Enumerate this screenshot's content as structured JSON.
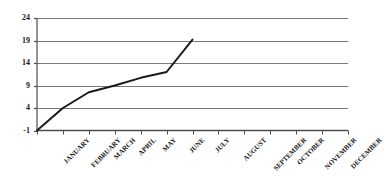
{
  "chart_data": {
    "type": "line",
    "title": "",
    "subtitle": "",
    "xlabel": "",
    "ylabel": "",
    "categories": [
      "JANUARY",
      "FEBRUARY",
      "MARCH",
      "APRIL",
      "MAY",
      "JUNE",
      "JULY",
      "AUGUST",
      "SEPTEMBER",
      "OCTOBER",
      "NOVEMBER",
      "DECEMBER"
    ],
    "values": [
      -1,
      4,
      7.5,
      9,
      10.7,
      12,
      19.2,
      null,
      null,
      null,
      null,
      null
    ],
    "series": [
      {
        "name": "",
        "values": [
          -1,
          4,
          7.5,
          9,
          10.7,
          12,
          19.2,
          null,
          null,
          null,
          null,
          null
        ]
      }
    ],
    "ylim": [
      -1,
      24
    ],
    "ytick_labels": [
      "24",
      "19",
      "14",
      "9",
      "4",
      "-1"
    ],
    "ytick_values": [
      24,
      19,
      14,
      9,
      4,
      -1
    ],
    "grid": "horizontal",
    "legend": "none",
    "line_color": "#1a1a1a",
    "grid_color": "#7a7a7a",
    "axis_color": "#4d4d4d",
    "background": "#ffffff"
  }
}
